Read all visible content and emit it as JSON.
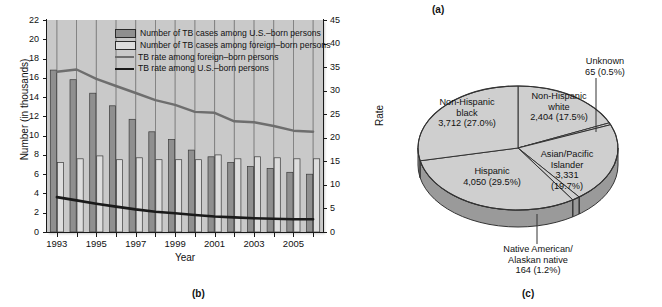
{
  "figure_labels": {
    "a": "(a)",
    "b": "(b)",
    "c": "(c)"
  },
  "chart_panel": {
    "y_axis_title": "Number (in thousands)",
    "x_axis_title": "Year",
    "y2_axis_title": "Rate",
    "legend": [
      {
        "key": "us_cases",
        "label": "Number of TB cases among U.S.–born persons",
        "marker": "bar-dark",
        "color": "#8f8f8f"
      },
      {
        "key": "foreign_cases",
        "label": "Number of TB cases among foreign–born persons",
        "marker": "bar-light",
        "color": "#dddddd"
      },
      {
        "key": "foreign_rate",
        "label": "TB rate among foreign–born persons",
        "marker": "line-gray",
        "color": "#6e6e6e"
      },
      {
        "key": "us_rate",
        "label": "TB rate among U.S.–born persons",
        "marker": "line-black",
        "color": "#1a1a1a"
      }
    ]
  },
  "chart_data": {
    "type": "bar",
    "title": "",
    "xlabel": "Year",
    "ylabel": "Number (in thousands)",
    "y2label": "Rate",
    "ylim": [
      0,
      22
    ],
    "y2lim": [
      0,
      45
    ],
    "yticks": [
      0,
      2,
      4,
      6,
      8,
      10,
      12,
      14,
      16,
      18,
      20,
      22
    ],
    "y2ticks": [
      0,
      5,
      10,
      15,
      20,
      25,
      30,
      35,
      40,
      45
    ],
    "grid": false,
    "legend_position": "top-right",
    "categories": [
      1993,
      1994,
      1995,
      1996,
      1997,
      1998,
      1999,
      2000,
      2001,
      2002,
      2003,
      2004,
      2005,
      2006
    ],
    "xtick_labels": [
      "1993",
      "1995",
      "1997",
      "1999",
      "2001",
      "2003",
      "2005"
    ],
    "series": [
      {
        "name": "Number of TB cases among U.S.–born persons",
        "type": "bar",
        "axis": "left",
        "color": "#8f8f8f",
        "values": [
          16.8,
          15.8,
          14.4,
          13.1,
          11.7,
          10.4,
          9.6,
          8.5,
          7.8,
          7.2,
          6.8,
          6.6,
          6.2,
          6.0
        ]
      },
      {
        "name": "Number of TB cases among foreign–born persons",
        "type": "bar",
        "axis": "left",
        "color": "#dddddd",
        "values": [
          7.2,
          7.6,
          7.9,
          7.5,
          7.7,
          7.5,
          7.5,
          7.5,
          8.0,
          7.6,
          7.8,
          7.7,
          7.6,
          7.6
        ]
      },
      {
        "name": "TB rate among foreign–born persons",
        "type": "line",
        "axis": "right",
        "color": "#6e6e6e",
        "values": [
          34.0,
          34.5,
          32.5,
          31.0,
          29.5,
          28.0,
          27.0,
          25.5,
          25.3,
          23.5,
          23.3,
          22.5,
          21.5,
          21.3
        ]
      },
      {
        "name": "TB rate among U.S.–born persons",
        "type": "line",
        "axis": "right",
        "color": "#1a1a1a",
        "values": [
          7.4,
          6.7,
          6.0,
          5.4,
          4.8,
          4.3,
          4.0,
          3.6,
          3.3,
          3.1,
          2.9,
          2.8,
          2.7,
          2.7
        ]
      }
    ]
  },
  "pie_chart": {
    "type": "pie",
    "title": "",
    "slices": [
      {
        "label": "Non-Hispanic\nwhite",
        "label_line1": "Non-Hispanic",
        "label_line2": "white",
        "count": "2,404",
        "percent": "17.5%",
        "value_text": "2,404 (17.5%)",
        "value": 17.5
      },
      {
        "label": "Unknown",
        "label_line1": "Unknown",
        "label_line2": "",
        "count": "65",
        "percent": "0.5%",
        "value_text": "65 (0.5%)",
        "value": 0.5
      },
      {
        "label": "Asian/Pacific Islander",
        "label_line1": "Asian/Pacific",
        "label_line2": "Islander",
        "count": "3,331",
        "percent": "19.7%",
        "value_text": "3,331",
        "percent_text": "(19.7%)",
        "value": 19.7
      },
      {
        "label": "Native American/ Alaskan native",
        "label_line1": "Native American/",
        "label_line2": "Alaskan native",
        "count": "164",
        "percent": "1.2%",
        "value_text": "164 (1.2%)",
        "value": 1.2
      },
      {
        "label": "Hispanic",
        "label_line1": "Hispanic",
        "label_line2": "",
        "count": "4,050",
        "percent": "29.5%",
        "value_text": "4,050 (29.5%)",
        "value": 29.5
      },
      {
        "label": "Non-Hispanic\nblack",
        "label_line1": "Non-Hispanic",
        "label_line2": "black",
        "count": "3,712",
        "percent": "27.0%",
        "value_text": "3,712 (27.0%)",
        "value": 27.0
      }
    ]
  },
  "colors": {
    "plot_background": "#c9c9c9",
    "bar_dark": "#8f8f8f",
    "bar_light": "#dddddd",
    "line_gray": "#6e6e6e",
    "line_black": "#1a1a1a",
    "pie_face": "#cfcfcf",
    "pie_side": "#9a9a9a",
    "axis": "#1a1a1a"
  }
}
